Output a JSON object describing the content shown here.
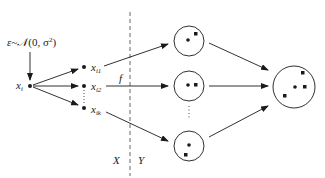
{
  "diagram": {
    "noise_label": "ε~𝒩(0, σ²)",
    "noise_parts": {
      "eps": "ε~",
      "N": "𝒩",
      "args": "(0, σ",
      "sup": "2",
      "close": ")"
    },
    "source_node": {
      "base": "x",
      "sub": "i"
    },
    "perturbed_nodes": [
      {
        "base": "x",
        "sub": "i1"
      },
      {
        "base": "x",
        "sub": "i2"
      },
      {
        "base": "x",
        "sub": "ik"
      }
    ],
    "function_label": "f",
    "input_space_label": "X",
    "output_space_label": "Y",
    "ellipsis": "⋮",
    "output_sets": [
      {
        "name": "output-set-1"
      },
      {
        "name": "output-set-2"
      },
      {
        "name": "output-set-k"
      }
    ],
    "aggregate_set": {
      "name": "aggregated-output-set"
    },
    "colors": {
      "stroke": "#1a1a1a",
      "dashed": "#555555",
      "background": "#ffffff"
    }
  }
}
